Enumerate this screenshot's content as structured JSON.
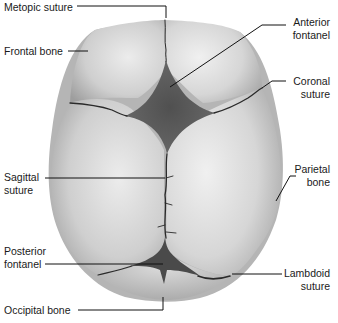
{
  "diagram": {
    "labels": {
      "metopic_suture": "Metopic suture",
      "frontal_bone": "Frontal bone",
      "anterior_fontanel_1": "Anterior",
      "anterior_fontanel_2": "fontanel",
      "coronal_suture_1": "Coronal",
      "coronal_suture_2": "suture",
      "sagittal_suture_1": "Sagittal",
      "sagittal_suture_2": "suture",
      "parietal_bone_1": "Parietal",
      "parietal_bone_2": "bone",
      "posterior_fontanel_1": "Posterior",
      "posterior_fontanel_2": "fontanel",
      "lambdoid_suture_1": "Lambdoid",
      "lambdoid_suture_2": "suture",
      "occipital_bone": "Occipital bone"
    },
    "colors": {
      "bone_light": "#e6e6e6",
      "bone_mid": "#c4c4c4",
      "bone_dark": "#9a9a9a",
      "fontanel": "#5a5a5a",
      "suture": "#2a2a2a",
      "leader_line": "#111111",
      "text": "#1a1a1a"
    }
  }
}
